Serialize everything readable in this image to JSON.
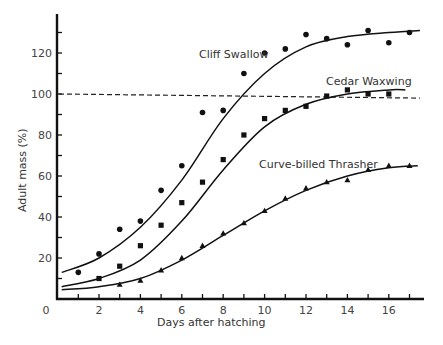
{
  "chart_data": {
    "type": "scatter",
    "title": "",
    "xlabel": "Days after hatching",
    "ylabel": "Adult mass (%)",
    "xlim": [
      0,
      18
    ],
    "ylim": [
      0,
      140
    ],
    "x_ticks": [
      0,
      2,
      4,
      6,
      8,
      10,
      12,
      14,
      16
    ],
    "x_minor_ticks": [
      1,
      3,
      5,
      7,
      9,
      11,
      13,
      15,
      17
    ],
    "y_ticks": [
      20,
      40,
      60,
      80,
      100,
      120
    ],
    "y_minor_ticks": [
      10,
      30,
      50,
      70,
      90,
      110,
      130
    ],
    "grid": false,
    "legend": "inline labels",
    "reference_line": {
      "y_start": 100,
      "y_end": 98,
      "x_start": 0,
      "x_end": 17.5,
      "style": "dashed",
      "label": ""
    },
    "series": [
      {
        "name": "Cliff Swallow",
        "marker": "circle",
        "x": [
          1,
          2,
          3,
          4,
          5,
          6,
          7,
          8,
          9,
          10,
          11,
          12,
          13,
          14,
          15,
          16,
          17
        ],
        "values": [
          13,
          22,
          34,
          38,
          53,
          65,
          91,
          92,
          110,
          120,
          122,
          129,
          127,
          124,
          131,
          125,
          130
        ],
        "fit_curve": [
          [
            0.2,
            13
          ],
          [
            2,
            20
          ],
          [
            4,
            35
          ],
          [
            6,
            58
          ],
          [
            8,
            88
          ],
          [
            10,
            110
          ],
          [
            12,
            123
          ],
          [
            14,
            128
          ],
          [
            16,
            130
          ],
          [
            17.5,
            131
          ]
        ],
        "label_position": [
          199,
          57
        ]
      },
      {
        "name": "Cedar Waxwing",
        "marker": "square",
        "x": [
          2,
          3,
          4,
          5,
          6,
          7,
          8,
          9,
          10,
          11,
          12,
          13,
          14,
          15,
          16
        ],
        "values": [
          10,
          16,
          26,
          36,
          47,
          57,
          68,
          80,
          88,
          92,
          94,
          99,
          102,
          100,
          100
        ],
        "fit_curve": [
          [
            0.2,
            6
          ],
          [
            2,
            10
          ],
          [
            4,
            19
          ],
          [
            6,
            38
          ],
          [
            8,
            63
          ],
          [
            10,
            84
          ],
          [
            12,
            95
          ],
          [
            14,
            100
          ],
          [
            16,
            102
          ],
          [
            16.8,
            102
          ]
        ],
        "label_position": [
          326,
          85
        ]
      },
      {
        "name": "Curve-billed Thrasher",
        "marker": "triangle",
        "x": [
          3,
          4,
          5,
          6,
          7,
          8,
          9,
          10,
          11,
          12,
          13,
          14,
          15,
          16,
          17
        ],
        "values": [
          7,
          9,
          14,
          20,
          26,
          32,
          37,
          43,
          49,
          54,
          57,
          58,
          63,
          65,
          65
        ],
        "fit_curve": [
          [
            0.2,
            4.5
          ],
          [
            2,
            6
          ],
          [
            4,
            10
          ],
          [
            6,
            19
          ],
          [
            8,
            31
          ],
          [
            10,
            43
          ],
          [
            12,
            53
          ],
          [
            14,
            60
          ],
          [
            16,
            64
          ],
          [
            17.4,
            65
          ]
        ],
        "label_position": [
          259,
          168
        ]
      }
    ]
  },
  "labels": {
    "xlabel": "Days after hatching",
    "ylabel": "Adult mass (%)",
    "series_1": "Cliff Swallow",
    "series_2": "Cedar Waxwing",
    "series_3": "Curve-billed Thrasher",
    "origin": "0"
  }
}
